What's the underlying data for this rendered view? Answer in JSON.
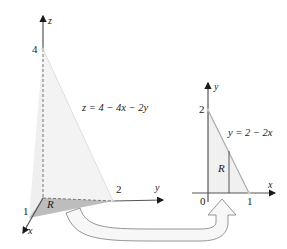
{
  "left_figure": {
    "axes": {
      "z": "z",
      "y": "y",
      "x": "x"
    },
    "ticks": {
      "z": "4",
      "y": "2",
      "x": "1"
    },
    "equation": "z = 4 − 4x − 2y",
    "region_label": "R"
  },
  "right_figure": {
    "axes": {
      "y": "y",
      "x": "x"
    },
    "ticks": {
      "y": "2",
      "x": "1",
      "origin": "0"
    },
    "equation": "y = 2 − 2x",
    "region_label": "R"
  },
  "colors": {
    "axis": "#444444",
    "surface": "#ececec",
    "region_shadow": "#bdbdbd",
    "region_fill": "#f0f0f0",
    "arrow_outline": "#8a8a8a",
    "arrow_fill": "#f7f7f7",
    "line": "#aaaaaa"
  }
}
